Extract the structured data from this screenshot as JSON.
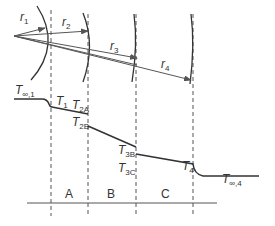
{
  "radii": [
    {
      "label": "r",
      "sub": "1"
    },
    {
      "label": "r",
      "sub": "2"
    },
    {
      "label": "r",
      "sub": "3"
    },
    {
      "label": "r",
      "sub": "4"
    }
  ],
  "temperatures": {
    "t_inf_1": {
      "main": "T",
      "sub": "∞,1"
    },
    "t1": {
      "main": "T",
      "sub": "1"
    },
    "t2a": {
      "main": "T",
      "sub": "2A"
    },
    "t2b": {
      "main": "T",
      "sub": "2B"
    },
    "t3b": {
      "main": "T",
      "sub": "3B"
    },
    "t3c": {
      "main": "T",
      "sub": "3C"
    },
    "t4": {
      "main": "T",
      "sub": "4"
    },
    "t_inf_4": {
      "main": "T",
      "sub": "∞,4"
    }
  },
  "layers": [
    "A",
    "B",
    "C"
  ],
  "colors": {
    "line": "#333333",
    "dash": "#555555"
  }
}
